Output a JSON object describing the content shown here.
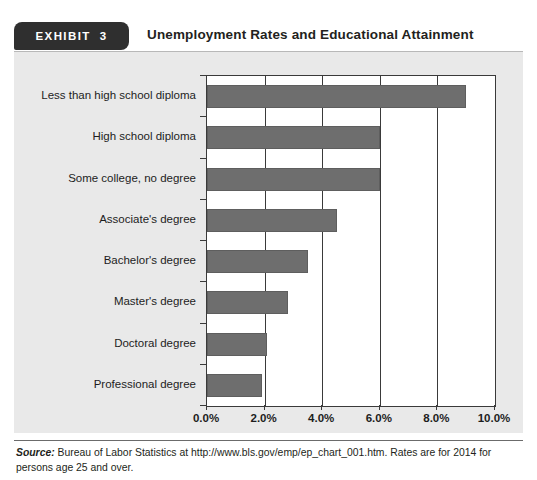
{
  "exhibit": {
    "badge_label": "EXHIBIT",
    "badge_number": "3",
    "title": "Unemployment Rates and Educational Attainment"
  },
  "source": {
    "label": "Source:",
    "text": " Bureau of Labor Statistics at http://www.bls.gov/emp/ep_chart_001.htm. Rates are for 2014 for persons age 25 and over."
  },
  "colors": {
    "bar": "#6e6e6e",
    "panel_background": "#e9e9e9",
    "plot_background": "#ffffff",
    "axis": "#3a3a3a",
    "badge_background": "#2f2f2f"
  },
  "chart_data": {
    "type": "bar",
    "orientation": "horizontal",
    "title": "Unemployment Rates and Educational Attainment",
    "xlabel": "",
    "ylabel": "",
    "categories": [
      "Less than high school diploma",
      "High school diploma",
      "Some college, no degree",
      "Associate's degree",
      "Bachelor's degree",
      "Master's degree",
      "Doctoral degree",
      "Professional degree"
    ],
    "values": [
      9.0,
      6.0,
      6.0,
      4.5,
      3.5,
      2.8,
      2.1,
      1.9
    ],
    "xlim": [
      0,
      10
    ],
    "xticks": [
      0,
      2,
      4,
      6,
      8,
      10
    ],
    "xticklabels": [
      "0.0%",
      "2.0%",
      "4.0%",
      "6.0%",
      "8.0%",
      "10.0%"
    ],
    "grid": "vertical",
    "legend": "none"
  }
}
